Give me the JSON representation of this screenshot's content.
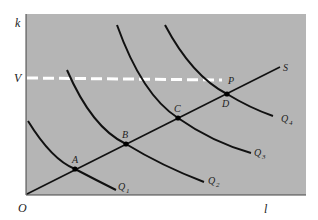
{
  "diagram": {
    "axis_labels": {
      "y": "k",
      "x": "l",
      "origin": "O",
      "v_level": "V"
    },
    "line_label": "S",
    "points": [
      {
        "id": "A",
        "label": "A"
      },
      {
        "id": "B",
        "label": "B"
      },
      {
        "id": "C",
        "label": "C"
      },
      {
        "id": "D",
        "label": "D"
      },
      {
        "id": "P",
        "label": "P"
      }
    ],
    "curves": [
      {
        "id": "Q1",
        "label": "Q",
        "sub": "1"
      },
      {
        "id": "Q2",
        "label": "Q",
        "sub": "2"
      },
      {
        "id": "Q3",
        "label": "Q",
        "sub": "3"
      },
      {
        "id": "Q4",
        "label": "Q",
        "sub": "4"
      }
    ],
    "colors": {
      "background": "#b5b5b5",
      "line": "#111111",
      "dashed": "#ffffff",
      "axis": "#444444"
    }
  }
}
